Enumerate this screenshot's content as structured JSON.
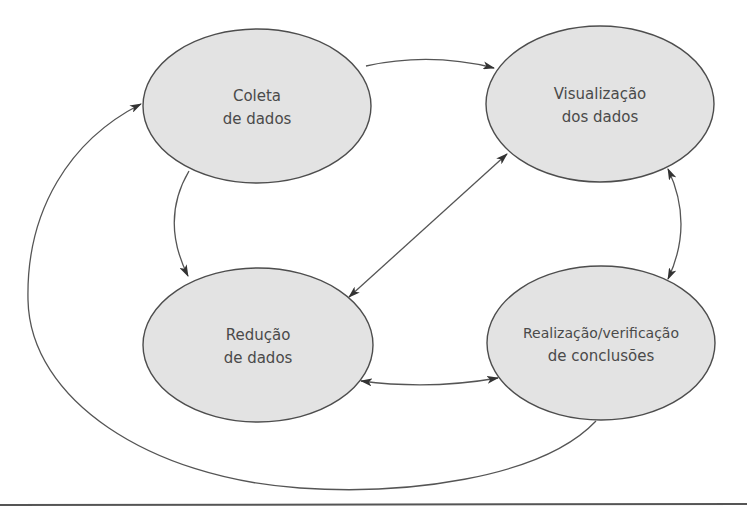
{
  "diagram": {
    "type": "flow-cycle",
    "colors": {
      "node_fill": "#e3e3e3",
      "node_stroke": "#4d4d4d",
      "edge": "#555555",
      "text": "#4a4a4a",
      "background": "#ffffff"
    },
    "nodes": [
      {
        "id": "coleta",
        "line1": "Coleta",
        "line2": "de dados"
      },
      {
        "id": "visualizacao",
        "line1": "Visualização",
        "line2": "dos dados"
      },
      {
        "id": "reducao",
        "line1": "Redução",
        "line2": "de dados"
      },
      {
        "id": "realizacao",
        "line1": "Realização/verificação",
        "line2": "de conclusões"
      }
    ],
    "edges": [
      {
        "from": "coleta",
        "to": "visualizacao",
        "direction": "one-way"
      },
      {
        "from": "coleta",
        "to": "reducao",
        "direction": "one-way"
      },
      {
        "from": "reducao",
        "to": "visualizacao",
        "direction": "two-way"
      },
      {
        "from": "visualizacao",
        "to": "realizacao",
        "direction": "two-way"
      },
      {
        "from": "reducao",
        "to": "realizacao",
        "direction": "two-way"
      },
      {
        "from": "realizacao",
        "to": "coleta",
        "direction": "one-way"
      }
    ]
  }
}
